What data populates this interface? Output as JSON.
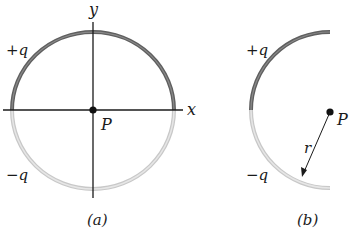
{
  "figure": {
    "panel_a": {
      "caption": "(a)",
      "axis_x_label": "x",
      "axis_y_label": "y",
      "top_half_label": "+q",
      "bottom_half_label": "−q",
      "point_label": "P"
    },
    "panel_b": {
      "caption": "(b)",
      "top_quarter_label": "+q",
      "bottom_quarter_label": "−q",
      "point_label": "P",
      "radius_label": "r"
    },
    "colors": {
      "positive_charge": "#6e6e6e",
      "negative_charge": "#c8c8c8",
      "axes": "#1a1a1a"
    }
  }
}
